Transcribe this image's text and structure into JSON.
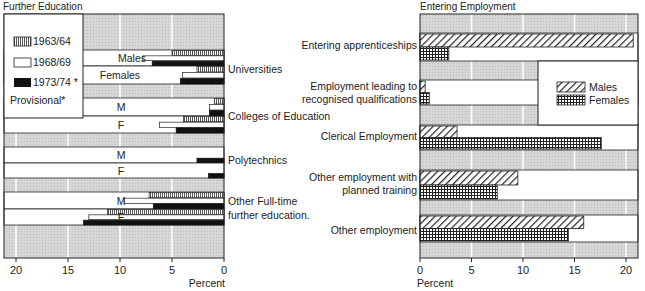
{
  "chart_data": [
    {
      "type": "bar",
      "orientation": "horizontal",
      "title": "Further Education",
      "xlabel": "Percent",
      "xlim": [
        0,
        21
      ],
      "x_direction": "reversed",
      "xticks": [
        "0",
        "5",
        "10",
        "15",
        "20"
      ],
      "xtick_values": [
        0,
        5,
        10,
        15,
        20
      ],
      "grid": true,
      "legend": {
        "placement": "top-left",
        "entries": [
          "1963/64",
          "1968/69",
          "1973/74 *"
        ],
        "note": "Provisional*"
      },
      "categories": [
        {
          "name": "Universities",
          "sub": [
            {
              "label": "Males",
              "values": {
                "1963/64": 5.0,
                "1968/69": 7.8,
                "1973/74": 6.9
              }
            },
            {
              "label": "Females",
              "values": {
                "1963/64": 2.6,
                "1968/69": 4.0,
                "1973/74": 4.2
              }
            }
          ]
        },
        {
          "name": "Colleges of Education",
          "sub": [
            {
              "label": "M",
              "values": {
                "1963/64": 0.9,
                "1968/69": 1.4,
                "1973/74": 1.4
              }
            },
            {
              "label": "F",
              "values": {
                "1963/64": 3.9,
                "1968/69": 6.2,
                "1973/74": 4.6
              }
            }
          ]
        },
        {
          "name": "Polytechnics",
          "sub": [
            {
              "label": "M",
              "values": {
                "1963/64": 0,
                "1968/69": 0,
                "1973/74": 2.6
              }
            },
            {
              "label": "F",
              "values": {
                "1963/64": 0,
                "1968/69": 0,
                "1973/74": 1.5
              }
            }
          ]
        },
        {
          "name": "Other Full-time further education.",
          "name_lines": [
            "Other Full-time",
            "further education."
          ],
          "sub": [
            {
              "label": "M",
              "values": {
                "1963/64": 7.2,
                "1968/69": 9.6,
                "1973/74": 6.8
              }
            },
            {
              "label": "F",
              "values": {
                "1963/64": 11.2,
                "1968/69": 13.0,
                "1973/74": 13.5
              }
            }
          ]
        }
      ]
    },
    {
      "type": "bar",
      "orientation": "horizontal",
      "title": "Entering Employment",
      "xlabel": "Percent",
      "xlim": [
        0,
        21
      ],
      "xticks": [
        "0",
        "5",
        "10",
        "15",
        "20"
      ],
      "xtick_values": [
        0,
        5,
        10,
        15,
        20
      ],
      "grid": true,
      "legend": {
        "placement": "right",
        "entries": [
          "Males",
          "Females"
        ]
      },
      "categories": [
        "Entering apprenticeships",
        "Employment leading to recognised qualifications",
        "Clerical Employment",
        "Other employment with planned training",
        "Other employment"
      ],
      "category_lines": [
        [
          "Entering apprenticeships"
        ],
        [
          "Employment leading to",
          "recognised qualifications"
        ],
        [
          "Clerical Employment"
        ],
        [
          "Other employment with",
          "planned training"
        ],
        [
          "Other employment"
        ]
      ],
      "series": [
        {
          "name": "Males",
          "values": [
            20.7,
            0.5,
            3.6,
            9.5,
            15.9
          ]
        },
        {
          "name": "Females",
          "values": [
            2.8,
            0.9,
            17.6,
            7.5,
            14.4
          ]
        }
      ]
    }
  ],
  "colors": {
    "band": "#d4d4d4",
    "ink": "#111111",
    "paper": "#ffffff"
  }
}
